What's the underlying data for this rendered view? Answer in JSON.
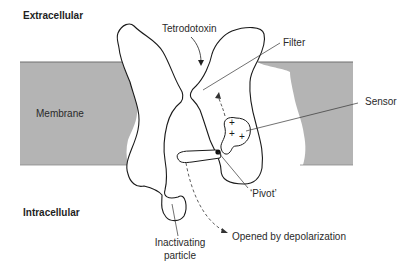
{
  "diagram": {
    "regions": {
      "extracellular": "Extracellular",
      "membrane": "Membrane",
      "intracellular": "Intracellular"
    },
    "labels": {
      "tetrodotoxin": "Tetrodotoxin",
      "filter": "Filter",
      "sensor": "Sensor",
      "pivot": "‘Pivot’",
      "inactivating_line1": "Inactivating",
      "inactivating_line2": "particle",
      "opened": "Opened by depolarization"
    },
    "sensor_charges": [
      "+",
      "+",
      "+"
    ],
    "colors": {
      "membrane_fill": "#b4b4b4",
      "membrane_edge": "#6e6e6e",
      "outline": "#1a1a1a",
      "background": "#ffffff"
    }
  }
}
